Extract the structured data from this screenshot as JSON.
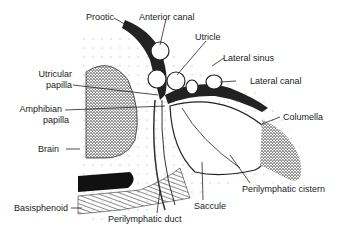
{
  "figure": {
    "type": "anatomical-diagram",
    "labels": {
      "prootic": "Prootic",
      "anterior_canal": "Anterior canal",
      "utricle": "Utricle",
      "lateral_sinus": "Lateral sinus",
      "lateral_canal": "Lateral canal",
      "utricular_papilla_1": "Utricular",
      "utricular_papilla_2": "papilla",
      "amphibian_papilla_1": "Amphibian",
      "amphibian_papilla_2": "papilla",
      "columella": "Columella",
      "brain": "Brain",
      "basisphenoid": "Basisphenoid",
      "perilymphatic_duct": "Perilymphatic duct",
      "saccule": "Saccule",
      "perilymphatic_cistern": "Perilymphatic cistern"
    },
    "colors": {
      "ink": "#1a1a1a",
      "stipple": "#555555",
      "background": "#ffffff"
    }
  }
}
